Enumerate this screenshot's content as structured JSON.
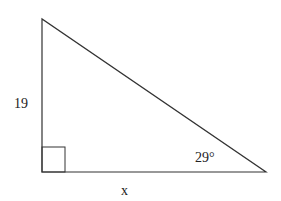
{
  "diagram": {
    "type": "right-triangle",
    "labels": {
      "vertical_side": "19",
      "angle": "29°",
      "horizontal_side": "x"
    },
    "colors": {
      "stroke": "#333333",
      "background": "#ffffff"
    }
  }
}
